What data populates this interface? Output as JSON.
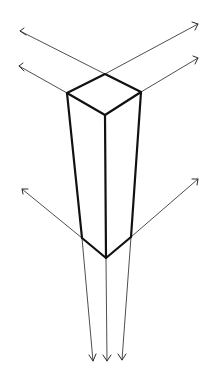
{
  "figure": {
    "title": "Three-point perspective box with vanishing guide lines",
    "colors": {
      "background": "#ffffff",
      "box_edges": "#111111",
      "guide_lines": "#3a3a3a"
    }
  },
  "box": {
    "top_face": {
      "back": [
        105,
        74
      ],
      "left": [
        67,
        93
      ],
      "right": [
        141,
        92
      ],
      "front": [
        105,
        115
      ]
    },
    "bottom_face": {
      "left": [
        82,
        238
      ],
      "front": [
        106,
        258
      ],
      "right": [
        131,
        237
      ]
    }
  },
  "guide_lines": {
    "left_upper": {
      "from": [
        105,
        74
      ],
      "to": [
        20,
        31
      ]
    },
    "left_lower": {
      "from": [
        67,
        93
      ],
      "to": [
        19,
        66
      ]
    },
    "right_upper": {
      "from": [
        105,
        74
      ],
      "to": [
        198,
        24
      ]
    },
    "right_lower": {
      "from": [
        141,
        92
      ],
      "to": [
        198,
        58
      ]
    },
    "bottom_left_out": {
      "from": [
        82,
        238
      ],
      "to": [
        22,
        189
      ]
    },
    "bottom_right_out": {
      "from": [
        131,
        237
      ],
      "to": [
        198,
        179
      ]
    },
    "down_left": {
      "from": [
        82,
        238
      ],
      "to": [
        93,
        361
      ]
    },
    "down_center": {
      "from": [
        106,
        258
      ],
      "to": [
        107,
        361
      ]
    },
    "down_right": {
      "from": [
        131,
        237
      ],
      "to": [
        122,
        360
      ]
    }
  }
}
